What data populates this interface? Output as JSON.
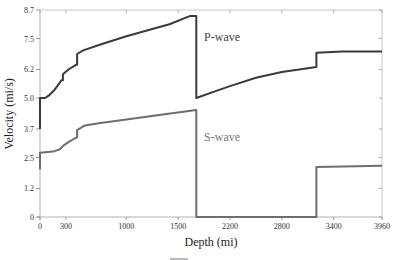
{
  "chart_data": {
    "type": "line",
    "title": "",
    "xlabel": "Depth (mi)",
    "ylabel": "Velocity (mi/s)",
    "xlim": [
      0,
      3960
    ],
    "ylim": [
      0,
      8.7
    ],
    "grid": false,
    "x_ticks": [
      {
        "value": 0,
        "label": "0"
      },
      {
        "value": 300,
        "label": "300"
      },
      {
        "value": 1000,
        "label": "1000"
      },
      {
        "value": 1600,
        "label": "1500"
      },
      {
        "value": 2200,
        "label": "2200"
      },
      {
        "value": 2800,
        "label": "2800"
      },
      {
        "value": 3400,
        "label": "3400"
      },
      {
        "value": 3960,
        "label": "3960"
      }
    ],
    "y_ticks": [
      {
        "value": 0,
        "label": "0"
      },
      {
        "value": 1.2,
        "label": "1.2"
      },
      {
        "value": 2.5,
        "label": "2.5"
      },
      {
        "value": 3.7,
        "label": "3.7"
      },
      {
        "value": 5.0,
        "label": "5.0"
      },
      {
        "value": 6.2,
        "label": "6.2"
      },
      {
        "value": 7.5,
        "label": "7.5"
      },
      {
        "value": 8.7,
        "label": "8.7"
      }
    ],
    "series": [
      {
        "name": "P-wave",
        "color": "#3a3a3a",
        "points": [
          [
            0,
            3.7
          ],
          [
            0,
            5.0
          ],
          [
            60,
            5.0
          ],
          [
            100,
            5.1
          ],
          [
            170,
            5.35
          ],
          [
            250,
            5.75
          ],
          [
            265,
            5.75
          ],
          [
            265,
            6.0
          ],
          [
            330,
            6.2
          ],
          [
            420,
            6.4
          ],
          [
            430,
            6.4
          ],
          [
            430,
            6.85
          ],
          [
            500,
            7.0
          ],
          [
            700,
            7.25
          ],
          [
            1000,
            7.6
          ],
          [
            1300,
            7.9
          ],
          [
            1500,
            8.1
          ],
          [
            1740,
            8.45
          ],
          [
            1810,
            8.45
          ],
          [
            1810,
            5.0
          ],
          [
            2000,
            5.25
          ],
          [
            2200,
            5.5
          ],
          [
            2500,
            5.85
          ],
          [
            2800,
            6.1
          ],
          [
            3200,
            6.3
          ],
          [
            3200,
            6.9
          ],
          [
            3500,
            6.95
          ],
          [
            3960,
            6.95
          ]
        ]
      },
      {
        "name": "S-wave",
        "color": "#6e6e6e",
        "points": [
          [
            0,
            2.0
          ],
          [
            0,
            2.7
          ],
          [
            150,
            2.75
          ],
          [
            230,
            2.85
          ],
          [
            270,
            3.0
          ],
          [
            330,
            3.15
          ],
          [
            400,
            3.3
          ],
          [
            430,
            3.35
          ],
          [
            430,
            3.65
          ],
          [
            520,
            3.85
          ],
          [
            700,
            3.95
          ],
          [
            1000,
            4.1
          ],
          [
            1400,
            4.3
          ],
          [
            1810,
            4.5
          ],
          [
            1810,
            0
          ],
          [
            3200,
            0
          ],
          [
            3200,
            2.1
          ],
          [
            3960,
            2.15
          ]
        ]
      }
    ],
    "annotations": [
      {
        "text": "P-wave",
        "x": 1900,
        "y": 7.4
      },
      {
        "text": "S-wave",
        "x": 1900,
        "y": 3.2
      }
    ]
  }
}
